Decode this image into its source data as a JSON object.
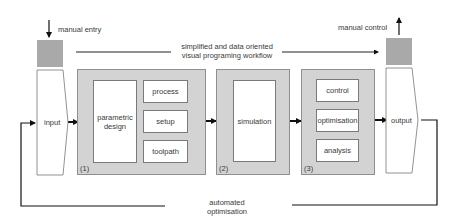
{
  "diagram": {
    "header": {
      "manual_entry": "manual entry",
      "manual_control": "manual control",
      "workflow_line1": "simplified and data oriented",
      "workflow_line2": "visual programing workflow"
    },
    "input": {
      "label": "input"
    },
    "output": {
      "label": "output"
    },
    "blocks": [
      {
        "number": "(1)",
        "main": {
          "line1": "parametric",
          "line2": "design"
        },
        "sub_items": [
          "process",
          "setup",
          "toolpath"
        ]
      },
      {
        "number": "(2)",
        "main": {
          "label": "simulation"
        }
      },
      {
        "number": "(3)",
        "sub_items": [
          "control",
          "optimisation",
          "analysis"
        ]
      }
    ],
    "feedback": {
      "line1": "automated",
      "line2": "optimisation"
    },
    "colors": {
      "block_fill": "#d3d3d3",
      "manual_square": "#a9a9a9",
      "line": "#111111"
    }
  }
}
